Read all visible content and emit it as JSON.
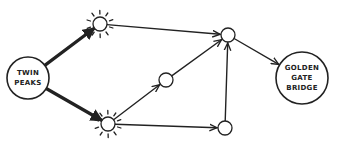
{
  "diagram": {
    "type": "directed-graph",
    "style": "hand-drawn sketch",
    "colors": {
      "stroke": "#222222",
      "background": "#ffffff"
    },
    "nodes": [
      {
        "id": "twin-peaks",
        "label_lines": [
          "TWIN",
          "PEAKS"
        ],
        "kind": "start",
        "x": 28,
        "y": 78,
        "r": 21
      },
      {
        "id": "top-left",
        "label_lines": [],
        "kind": "highlighted",
        "x": 100,
        "y": 24,
        "r": 7
      },
      {
        "id": "bottom-left",
        "label_lines": [],
        "kind": "highlighted",
        "x": 108,
        "y": 124,
        "r": 7
      },
      {
        "id": "middle",
        "label_lines": [],
        "kind": "plain",
        "x": 166,
        "y": 80,
        "r": 7
      },
      {
        "id": "top-right",
        "label_lines": [],
        "kind": "plain",
        "x": 228,
        "y": 35,
        "r": 7
      },
      {
        "id": "bottom-right",
        "label_lines": [],
        "kind": "plain",
        "x": 225,
        "y": 128,
        "r": 7
      },
      {
        "id": "golden-gate-bridge",
        "label_lines": [
          "GOLDEN",
          "GATE",
          "BRIDGE"
        ],
        "kind": "end",
        "x": 302,
        "y": 78,
        "r": 26
      }
    ],
    "edges": [
      {
        "from": "twin-peaks",
        "to": "top-left",
        "weight": "thick"
      },
      {
        "from": "twin-peaks",
        "to": "bottom-left",
        "weight": "thick"
      },
      {
        "from": "top-left",
        "to": "top-right",
        "weight": "normal"
      },
      {
        "from": "bottom-left",
        "to": "middle",
        "weight": "normal"
      },
      {
        "from": "bottom-left",
        "to": "bottom-right",
        "weight": "normal"
      },
      {
        "from": "middle",
        "to": "top-right",
        "weight": "normal"
      },
      {
        "from": "bottom-right",
        "to": "top-right",
        "weight": "normal"
      },
      {
        "from": "top-right",
        "to": "golden-gate-bridge",
        "weight": "normal"
      }
    ]
  },
  "labels": {
    "start_line1": "TWIN",
    "start_line2": "PEAKS",
    "end_line1": "GOLDEN",
    "end_line2": "GATE",
    "end_line3": "BRIDGE"
  }
}
